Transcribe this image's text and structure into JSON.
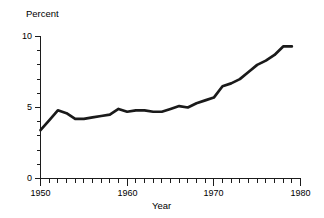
{
  "chart_data": {
    "type": "line",
    "title": "",
    "xlabel": "Year",
    "ylabel": "Percent",
    "xlim": [
      1950,
      1980
    ],
    "ylim": [
      0,
      10
    ],
    "grid": false,
    "legend": null,
    "y_ticks_major": [
      0,
      5,
      10
    ],
    "y_tick_labels": [
      "0",
      "5",
      "10"
    ],
    "y_minor_tick_step": 1,
    "x_ticks_major": [
      1950,
      1960,
      1970,
      1980
    ],
    "x_tick_labels": [
      "1950",
      "1960",
      "1970",
      "1980"
    ],
    "x_minor_tick_step": 1,
    "line_color": "#1a1a1a",
    "x": [
      1950,
      1951,
      1952,
      1953,
      1954,
      1955,
      1956,
      1957,
      1958,
      1959,
      1960,
      1961,
      1962,
      1963,
      1964,
      1965,
      1966,
      1967,
      1968,
      1969,
      1970,
      1971,
      1972,
      1973,
      1974,
      1975,
      1976,
      1977,
      1978,
      1979
    ],
    "values": [
      3.4,
      4.1,
      4.8,
      4.6,
      4.2,
      4.2,
      4.3,
      4.4,
      4.5,
      4.9,
      4.7,
      4.8,
      4.8,
      4.7,
      4.7,
      4.9,
      5.1,
      5.0,
      5.3,
      5.5,
      5.7,
      6.5,
      6.7,
      7.0,
      7.5,
      8.0,
      8.3,
      8.7,
      9.3,
      9.3
    ],
    "series": [
      {
        "name": "Percent",
        "values": [
          3.4,
          4.1,
          4.8,
          4.6,
          4.2,
          4.2,
          4.3,
          4.4,
          4.5,
          4.9,
          4.7,
          4.8,
          4.8,
          4.7,
          4.7,
          4.9,
          5.1,
          5.0,
          5.3,
          5.5,
          5.7,
          6.5,
          6.7,
          7.0,
          7.5,
          8.0,
          8.3,
          8.7,
          9.3,
          9.3
        ]
      }
    ]
  },
  "labels": {
    "y_axis_title": "Percent",
    "x_axis_title": "Year",
    "y_10": "10",
    "y_5": "5",
    "y_0": "0",
    "x_1950": "1950",
    "x_1960": "1960",
    "x_1970": "1970",
    "x_1980": "1980"
  }
}
